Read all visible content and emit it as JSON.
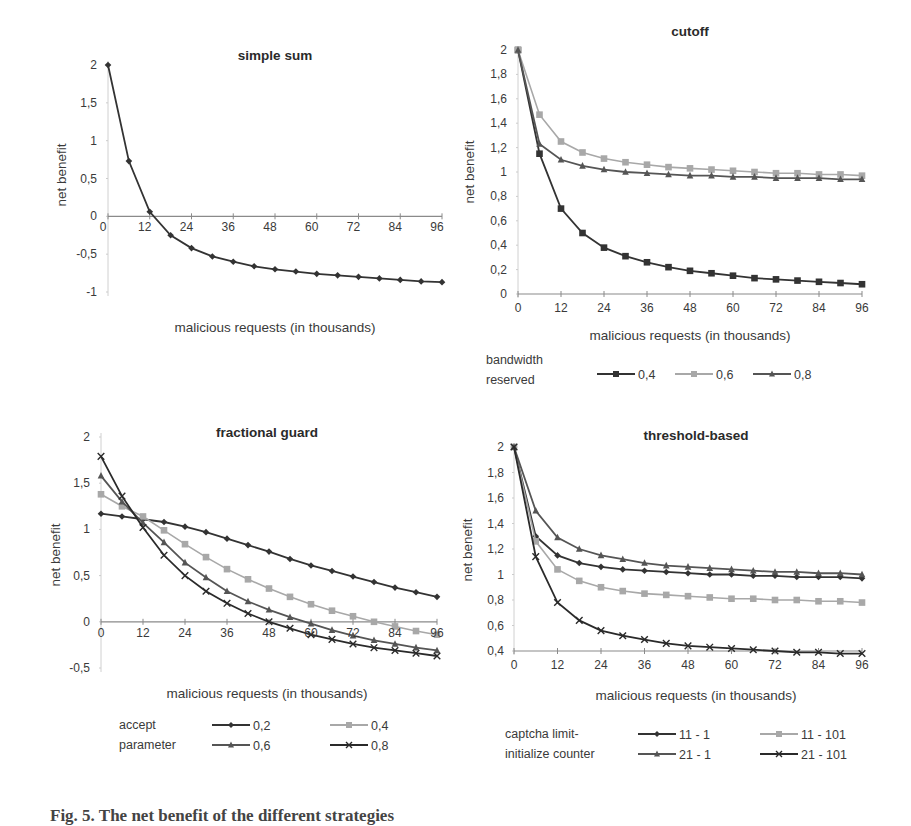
{
  "chart_data": [
    {
      "id": "simple_sum",
      "type": "line",
      "title": "simple sum",
      "xlabel": "malicious requests (in thousands)",
      "ylabel": "net benefit",
      "x": [
        0,
        6,
        12,
        18,
        24,
        30,
        36,
        42,
        48,
        54,
        60,
        66,
        72,
        78,
        84,
        90,
        96
      ],
      "x_ticks": [
        "0",
        "12",
        "24",
        "36",
        "48",
        "60",
        "72",
        "84",
        "96"
      ],
      "y_ticks": [
        "2",
        "1,5",
        "1",
        "0,5",
        "0",
        "-0,5",
        "-1"
      ],
      "ylim": [
        -1,
        2
      ],
      "xlim": [
        0,
        96
      ],
      "grid": false,
      "legend": null,
      "series": [
        {
          "name": "simple sum",
          "marker": "diamond",
          "color": "#333333",
          "values": [
            2,
            0.73,
            0.06,
            -0.25,
            -0.42,
            -0.53,
            -0.6,
            -0.66,
            -0.7,
            -0.73,
            -0.76,
            -0.78,
            -0.8,
            -0.82,
            -0.84,
            -0.86,
            -0.87
          ]
        }
      ]
    },
    {
      "id": "cutoff",
      "type": "line",
      "title": "cutoff",
      "xlabel": "malicious requests (in thousands)",
      "ylabel": "net benefit",
      "x": [
        0,
        6,
        12,
        18,
        24,
        30,
        36,
        42,
        48,
        54,
        60,
        66,
        72,
        78,
        84,
        90,
        96
      ],
      "x_ticks": [
        "0",
        "12",
        "24",
        "36",
        "48",
        "60",
        "72",
        "84",
        "96"
      ],
      "y_ticks": [
        "2",
        "1,8",
        "1,6",
        "1,4",
        "1,2",
        "1",
        "0,8",
        "0,6",
        "0,4",
        "0,2",
        "0"
      ],
      "ylim": [
        0,
        2
      ],
      "xlim": [
        0,
        96
      ],
      "grid": false,
      "legend": {
        "title_line1": "bandwidth",
        "title_line2": "reserved",
        "position": "bottom"
      },
      "series": [
        {
          "name": "0,4",
          "marker": "square",
          "color": "#333333",
          "values": [
            2,
            1.15,
            0.7,
            0.5,
            0.38,
            0.31,
            0.26,
            0.22,
            0.19,
            0.17,
            0.15,
            0.13,
            0.12,
            0.11,
            0.1,
            0.09,
            0.08
          ]
        },
        {
          "name": "0,6",
          "marker": "square",
          "color": "#a8a8a8",
          "values": [
            2,
            1.47,
            1.25,
            1.16,
            1.11,
            1.08,
            1.06,
            1.04,
            1.03,
            1.02,
            1.01,
            1.0,
            0.99,
            0.99,
            0.98,
            0.98,
            0.97
          ]
        },
        {
          "name": "0,8",
          "marker": "triangle",
          "color": "#555555",
          "values": [
            2,
            1.23,
            1.1,
            1.05,
            1.02,
            1.0,
            0.99,
            0.98,
            0.97,
            0.97,
            0.96,
            0.96,
            0.95,
            0.95,
            0.95,
            0.94,
            0.94
          ]
        }
      ]
    },
    {
      "id": "fractional_guard",
      "type": "line",
      "title": "fractional guard",
      "xlabel": "malicious requests (in thousands)",
      "ylabel": "net benefit",
      "x": [
        0,
        6,
        12,
        18,
        24,
        30,
        36,
        42,
        48,
        54,
        60,
        66,
        72,
        78,
        84,
        90,
        96
      ],
      "x_ticks": [
        "0",
        "12",
        "24",
        "36",
        "48",
        "60",
        "72",
        "84",
        "96"
      ],
      "y_ticks": [
        "2",
        "1,5",
        "1",
        "0,5",
        "0",
        "-0,5"
      ],
      "ylim": [
        -0.5,
        2
      ],
      "xlim": [
        0,
        96
      ],
      "grid": false,
      "legend": {
        "title_line1": "accept",
        "title_line2": "parameter",
        "position": "bottom"
      },
      "series": [
        {
          "name": "0,2",
          "marker": "diamond",
          "color": "#333333",
          "values": [
            1.17,
            1.14,
            1.11,
            1.08,
            1.03,
            0.97,
            0.9,
            0.83,
            0.76,
            0.68,
            0.61,
            0.55,
            0.49,
            0.43,
            0.37,
            0.32,
            0.27
          ]
        },
        {
          "name": "0,4",
          "marker": "square",
          "color": "#a8a8a8",
          "values": [
            1.38,
            1.25,
            1.14,
            0.99,
            0.84,
            0.7,
            0.57,
            0.46,
            0.36,
            0.27,
            0.19,
            0.12,
            0.06,
            0.0,
            -0.05,
            -0.1,
            -0.14
          ]
        },
        {
          "name": "0,6",
          "marker": "triangle",
          "color": "#555555",
          "values": [
            1.58,
            1.3,
            1.07,
            0.86,
            0.64,
            0.48,
            0.33,
            0.22,
            0.13,
            0.05,
            -0.02,
            -0.09,
            -0.15,
            -0.2,
            -0.24,
            -0.28,
            -0.31
          ]
        },
        {
          "name": "0,8",
          "marker": "cross",
          "color": "#2a2a2a",
          "values": [
            1.79,
            1.36,
            1.02,
            0.72,
            0.5,
            0.33,
            0.2,
            0.09,
            0.0,
            -0.07,
            -0.14,
            -0.19,
            -0.24,
            -0.28,
            -0.31,
            -0.34,
            -0.37
          ]
        }
      ]
    },
    {
      "id": "threshold_based",
      "type": "line",
      "title": "threshold-based",
      "xlabel": "malicious requests (in thousands)",
      "ylabel": "net benefit",
      "x": [
        0,
        6,
        12,
        18,
        24,
        30,
        36,
        42,
        48,
        54,
        60,
        66,
        72,
        78,
        84,
        90,
        96
      ],
      "x_ticks": [
        "0",
        "12",
        "24",
        "36",
        "48",
        "60",
        "72",
        "84",
        "96"
      ],
      "y_ticks": [
        "2",
        "1,8",
        "1,6",
        "1,4",
        "1,2",
        "1",
        "0,8",
        "0,6",
        "0,4"
      ],
      "ylim": [
        0.4,
        2
      ],
      "xlim": [
        0,
        96
      ],
      "grid": false,
      "legend": {
        "title_line1": "captcha limit-",
        "title_line2": "initialize counter",
        "position": "bottom"
      },
      "series": [
        {
          "name": "11 - 1",
          "marker": "diamond",
          "color": "#333333",
          "values": [
            2,
            1.3,
            1.15,
            1.09,
            1.06,
            1.04,
            1.03,
            1.02,
            1.01,
            1.0,
            1.0,
            0.99,
            0.99,
            0.98,
            0.98,
            0.98,
            0.97
          ]
        },
        {
          "name": "11 - 101",
          "marker": "square",
          "color": "#a8a8a8",
          "values": [
            2,
            1.26,
            1.04,
            0.95,
            0.9,
            0.87,
            0.85,
            0.84,
            0.83,
            0.82,
            0.81,
            0.81,
            0.8,
            0.8,
            0.79,
            0.79,
            0.78
          ]
        },
        {
          "name": "21 - 1",
          "marker": "triangle",
          "color": "#555555",
          "values": [
            2,
            1.5,
            1.29,
            1.2,
            1.15,
            1.12,
            1.09,
            1.07,
            1.06,
            1.05,
            1.04,
            1.03,
            1.02,
            1.02,
            1.01,
            1.01,
            1.0
          ]
        },
        {
          "name": "21 - 101",
          "marker": "cross",
          "color": "#2a2a2a",
          "values": [
            2,
            1.14,
            0.78,
            0.64,
            0.56,
            0.52,
            0.49,
            0.46,
            0.44,
            0.43,
            0.42,
            0.41,
            0.4,
            0.39,
            0.39,
            0.38,
            0.38
          ]
        }
      ]
    }
  ],
  "layout": {
    "panels": [
      {
        "x0": 108,
        "x1": 442,
        "ytop": 65,
        "ybot": 292,
        "xaxis_y_value": 0,
        "title_x": 275,
        "title_y": 60,
        "ylabel_x": 66,
        "ylabel_y": 175,
        "xlabel_x": 275,
        "xlabel_y": 332,
        "tick_x_label_dx": -5,
        "tick_label_right": 97,
        "xtick_label_dy": 15
      },
      {
        "x0": 518,
        "x1": 862,
        "ytop": 50,
        "ybot": 294,
        "xaxis_y_value": 0,
        "title_x": 690,
        "title_y": 36,
        "ylabel_x": 474,
        "ylabel_y": 172,
        "xlabel_x": 690,
        "xlabel_y": 340,
        "tick_x_label_dx": 0,
        "tick_label_right": 507,
        "xtick_label_dy": 18,
        "legend_x": 486,
        "legend_y": 372,
        "legend_items_x": [
          597,
          675,
          753
        ],
        "legend_rows": [
          [
            0,
            1,
            2
          ]
        ]
      },
      {
        "x0": 101,
        "x1": 437,
        "ytop": 437,
        "ybot": 668,
        "xaxis_y_value": 0,
        "title_x": 267,
        "title_y": 437,
        "ylabel_x": 60,
        "ylabel_y": 555,
        "xlabel_x": 267,
        "xlabel_y": 698,
        "tick_x_label_dx": 0,
        "tick_label_right": 90,
        "xtick_label_dy": 15,
        "legend_x": 119,
        "legend_y": 737,
        "legend_items_x": [
          212,
          330
        ],
        "legend_rows": [
          [
            0,
            1
          ],
          [
            2,
            3
          ]
        ]
      },
      {
        "x0": 514,
        "x1": 862,
        "ytop": 447,
        "ybot": 651,
        "xaxis_y_value": 0.4,
        "title_x": 696,
        "title_y": 440,
        "ylabel_x": 472,
        "ylabel_y": 550,
        "xlabel_x": 696,
        "xlabel_y": 700,
        "tick_x_label_dx": 0,
        "tick_label_right": 504,
        "xtick_label_dy": 18,
        "legend_x": 505,
        "legend_y": 746,
        "legend_items_x": [
          638,
          760
        ],
        "legend_rows": [
          [
            0,
            1
          ],
          [
            2,
            3
          ]
        ]
      }
    ]
  },
  "caption": "Fig. 5. The net benefit of the different strategies"
}
